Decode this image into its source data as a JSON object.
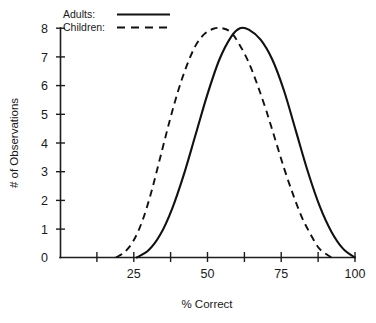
{
  "chart_data": {
    "type": "line",
    "title": "",
    "xlabel": "% Correct",
    "ylabel": "# of Observations",
    "xlim": [
      0,
      100
    ],
    "ylim": [
      0,
      8
    ],
    "grid": false,
    "legend_position": "top-left",
    "x_ticks": [
      12.5,
      25,
      37.5,
      50,
      62.5,
      75,
      87.5,
      100
    ],
    "x_tick_labels": [
      "",
      "25",
      "",
      "50",
      "",
      "75",
      "",
      "100"
    ],
    "y_ticks": [
      0,
      1,
      2,
      3,
      4,
      5,
      6,
      7,
      8
    ],
    "y_tick_labels": [
      "0",
      "1",
      "2",
      "3",
      "4",
      "5",
      "6",
      "7",
      "8"
    ],
    "series": [
      {
        "name": "Adults",
        "style": "solid",
        "color": "#111111",
        "peak_x": 61,
        "peak_y": 8,
        "x": [
          26,
          30,
          34,
          38,
          42,
          46,
          50,
          54,
          58,
          61,
          64,
          68,
          72,
          76,
          80,
          84,
          88,
          92,
          96,
          100
        ],
        "y": [
          0,
          0.25,
          0.8,
          1.7,
          2.9,
          4.3,
          5.7,
          6.9,
          7.7,
          8.0,
          7.95,
          7.6,
          6.9,
          5.8,
          4.4,
          3.0,
          1.8,
          0.9,
          0.3,
          0.0
        ]
      },
      {
        "name": "Children",
        "style": "dashed",
        "color": "#111111",
        "peak_x": 55,
        "peak_y": 8,
        "x": [
          19,
          22,
          25,
          28,
          31,
          34,
          37,
          40,
          43,
          46,
          49,
          52,
          55,
          58,
          61,
          64,
          67,
          70,
          73,
          76,
          79,
          82,
          85,
          88,
          92
        ],
        "y": [
          0,
          0.2,
          0.6,
          1.3,
          2.3,
          3.5,
          4.7,
          5.8,
          6.7,
          7.4,
          7.8,
          7.98,
          8.0,
          7.85,
          7.4,
          6.8,
          6.0,
          5.1,
          4.1,
          3.1,
          2.2,
          1.4,
          0.8,
          0.3,
          0.0
        ]
      }
    ]
  },
  "legend": {
    "items": [
      {
        "label": "Adults:",
        "style": "solid"
      },
      {
        "label": "Children:",
        "style": "dashed"
      }
    ]
  },
  "axes": {
    "y_title": "# of Observations",
    "x_title": "% Correct",
    "y_labels": [
      "8",
      "7",
      "6",
      "5",
      "4",
      "3",
      "2",
      "1",
      "0"
    ],
    "x_labels": [
      "25",
      "50",
      "75",
      "100"
    ]
  }
}
